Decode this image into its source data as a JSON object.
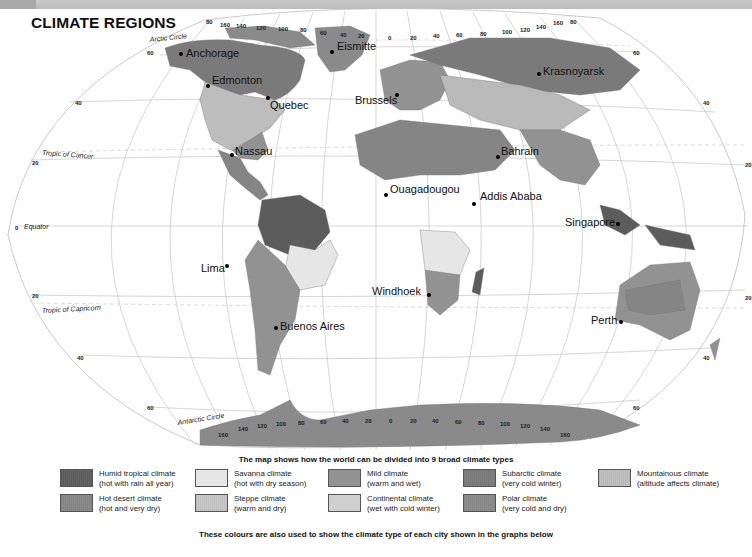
{
  "header": {
    "title": "CLIMATE REGIONS"
  },
  "map": {
    "lines": {
      "arctic_circle": "Arctic Circle",
      "tropic_cancer": "Tropic of Cancer",
      "equator": "Equator",
      "tropic_capricorn": "Tropic of Capricorn",
      "antarctic_circle": "Antarctic Circle"
    },
    "lat_labels": {
      "n60_left": "60",
      "n40_left": "40",
      "n20_left": "20",
      "eq_left": "0",
      "s20_left": "20",
      "s40_left": "40",
      "s60_left": "60",
      "n60_right": "60",
      "n40_right": "40",
      "n20_right": "20",
      "s20_right": "20",
      "s40_right": "40",
      "s60_right": "60"
    },
    "lon_labels_top": [
      "80",
      "160",
      "140",
      "120",
      "100",
      "80",
      "60",
      "40",
      "20",
      "0",
      "20",
      "40",
      "60",
      "80",
      "100",
      "120",
      "140",
      "160",
      "80"
    ],
    "lon_labels_bottom": [
      "160",
      "140",
      "120",
      "100",
      "80",
      "60",
      "40",
      "20",
      "0",
      "20",
      "40",
      "60",
      "80",
      "100",
      "120",
      "140",
      "160"
    ],
    "cities": [
      {
        "name": "Anchorage"
      },
      {
        "name": "Eismitte"
      },
      {
        "name": "Krasnoyarsk"
      },
      {
        "name": "Edmonton"
      },
      {
        "name": "Quebec"
      },
      {
        "name": "Brussels"
      },
      {
        "name": "Nassau"
      },
      {
        "name": "Bahrain"
      },
      {
        "name": "Ouagadougou"
      },
      {
        "name": "Addis Ababa"
      },
      {
        "name": "Singapore"
      },
      {
        "name": "Lima"
      },
      {
        "name": "Windhoek"
      },
      {
        "name": "Buenos Aires"
      },
      {
        "name": "Perth"
      }
    ]
  },
  "legend": {
    "heading": "The map shows how the world can be divided into 9 broad climate types",
    "footer": "These colours are also used to show the climate type of each city shown in the graphs below",
    "items": [
      {
        "name": "Humid tropical climate",
        "desc": "(hot with rain all year)",
        "color": "#5c5c5c"
      },
      {
        "name": "Savanna climate",
        "desc": "(hot with dry season)",
        "color": "#e6e6e6"
      },
      {
        "name": "Mild climate",
        "desc": "(warm and wet)",
        "color": "#929292"
      },
      {
        "name": "Subarctic climate",
        "desc": "(very cold winter)",
        "color": "#7a7a7a"
      },
      {
        "name": "Mountainous climate",
        "desc": "(altitude affects climate)",
        "color": "#b9b9b9"
      },
      {
        "name": "Hot desert climate",
        "desc": "(hot and very dry)",
        "color": "#858585"
      },
      {
        "name": "Steppe climate",
        "desc": "(warm and dry)",
        "color": "#c2c2c2"
      },
      {
        "name": "Continental climate",
        "desc": "(wet with cold winter)",
        "color": "#cfcfcf"
      },
      {
        "name": "Polar climate",
        "desc": "(very cold and dry)",
        "color": "#8a8a8a"
      }
    ]
  }
}
